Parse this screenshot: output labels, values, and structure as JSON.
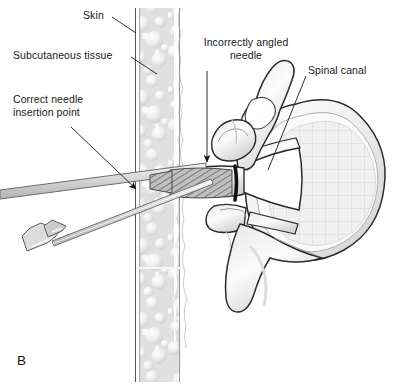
{
  "figure": {
    "panel_letter": "B",
    "type": "medical-illustration",
    "view": "axial cross-section of lumbar vertebra with needle insertion",
    "background_color": "#ffffff",
    "ink_color": "#1a1a1a",
    "bone_fill": "#f2f2f2",
    "bone_shade": "#d8d8d8",
    "tissue_fill": "#d9d9d9",
    "needle_fill": "#c9c9c9"
  },
  "labels": {
    "skin": "Skin",
    "subcutaneous_tissue": "Subcutaneous tissue",
    "correct_needle_insertion_point": "Correct needle\ninsertion point",
    "incorrectly_angled_needle": "Incorrectly angled\nneedle",
    "spinal_canal": "Spinal canal"
  },
  "anatomy": {
    "skin_layer": "skin-line",
    "subcutaneous_layer": "subcutaneous-tissue-column",
    "vertebral_body": "vertebral-body",
    "spinal_canal": "spinal-canal",
    "transverse_process": "transverse-process",
    "spinous_process": "spinous-process",
    "superior_articular_process": "superior-articular-process",
    "inferior_articular_process": "inferior-articular-process",
    "pedicle": "pedicle",
    "lamina": "lamina"
  },
  "instruments": {
    "correct_needle": "needle-correct-trajectory",
    "correct_needle_hub": "needle-hub",
    "incorrect_needle": "needle-incorrect-trajectory",
    "needle_tip_marker": "needle-tip-bone-contact"
  },
  "leaders": {
    "skin_leader": "leader-line-skin",
    "subcutaneous_leader": "leader-line-subcutaneous",
    "correct_point_arrow": "arrow-correct-insertion-point",
    "incorrect_needle_arrow": "arrow-incorrect-needle",
    "spinal_canal_leader": "leader-line-spinal-canal"
  }
}
